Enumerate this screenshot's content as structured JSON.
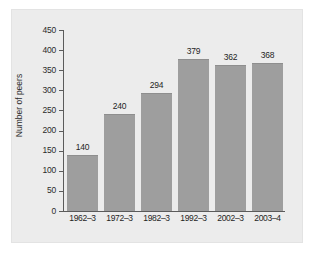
{
  "chart_data": {
    "type": "bar",
    "title": "",
    "subtitle": "",
    "xlabel": "",
    "ylabel": "Number of peers",
    "categories": [
      "1962–3",
      "1972–3",
      "1982–3",
      "1992–3",
      "2002–3",
      "2003–4"
    ],
    "values": [
      140,
      240,
      294,
      379,
      362,
      368
    ],
    "data_labels": [
      "140",
      "240",
      "294",
      "379",
      "362",
      "368"
    ],
    "ylim": [
      0,
      450
    ],
    "ytick_values": [
      0,
      50,
      100,
      150,
      200,
      250,
      300,
      350,
      400,
      450
    ],
    "ytick_labels": [
      "0",
      "50",
      "100",
      "150",
      "200",
      "250",
      "300",
      "350",
      "400",
      "450"
    ],
    "grid": false,
    "legend": false,
    "legend_position": "none",
    "series": [
      {
        "name": "Number of peers",
        "values": [
          140,
          240,
          294,
          379,
          362,
          368
        ]
      }
    ]
  },
  "style": {
    "bar_color": "#9e9e9e",
    "bar_edge_color": "#8e8e8e",
    "panel_background": "#ececec",
    "panel_border": "#e3e3e3",
    "page_background": "#ffffff",
    "axis_color": "#5b5b5b",
    "text_color": "#1f1f1f"
  }
}
